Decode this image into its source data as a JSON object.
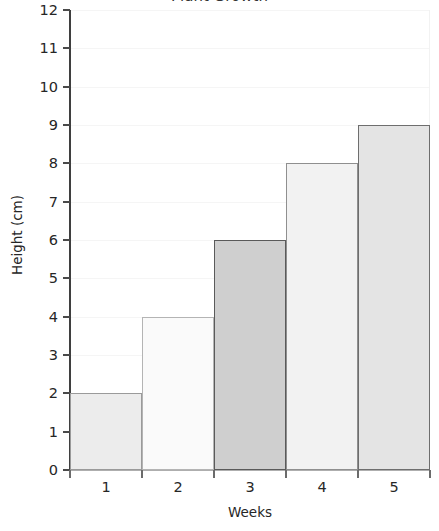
{
  "chart_data": {
    "type": "bar",
    "title": "Plant Growth",
    "categories": [
      "1",
      "2",
      "3",
      "4",
      "5"
    ],
    "values": [
      2,
      4,
      6,
      8,
      9
    ],
    "xlabel": "Weeks",
    "ylabel": "Height (cm)",
    "ylim": [
      0,
      12
    ],
    "ytick_step": 1,
    "yticks": [
      "12",
      "11",
      "10",
      "9",
      "8",
      "7",
      "6",
      "5",
      "4",
      "3",
      "2",
      "1",
      "0"
    ],
    "grid": "horizontal-only",
    "legend": "none",
    "bar_gap": 0,
    "series": [
      {
        "name": "Height",
        "values": [
          2,
          4,
          6,
          8,
          9
        ]
      }
    ],
    "bar_styles": [
      {
        "category": "1",
        "value": 2,
        "fill": "#ececec",
        "border": "#9a9a9a"
      },
      {
        "category": "2",
        "value": 4,
        "fill": "#fafafa",
        "border": "#b4b4b4"
      },
      {
        "category": "3",
        "value": 6,
        "fill": "#cfcfcf",
        "border": "#5a5a5a"
      },
      {
        "category": "4",
        "value": 8,
        "fill": "#f2f2f2",
        "border": "#8f8f8f"
      },
      {
        "category": "5",
        "value": 9,
        "fill": "#e4e4e4",
        "border": "#6e6e6e"
      }
    ],
    "colors": {
      "gridline": "#f5f5f5",
      "y_axis_spine": "#3f3f3f",
      "x_axis_spine": "#aeaeae",
      "text": "#262626",
      "background": "#ffffff"
    }
  }
}
